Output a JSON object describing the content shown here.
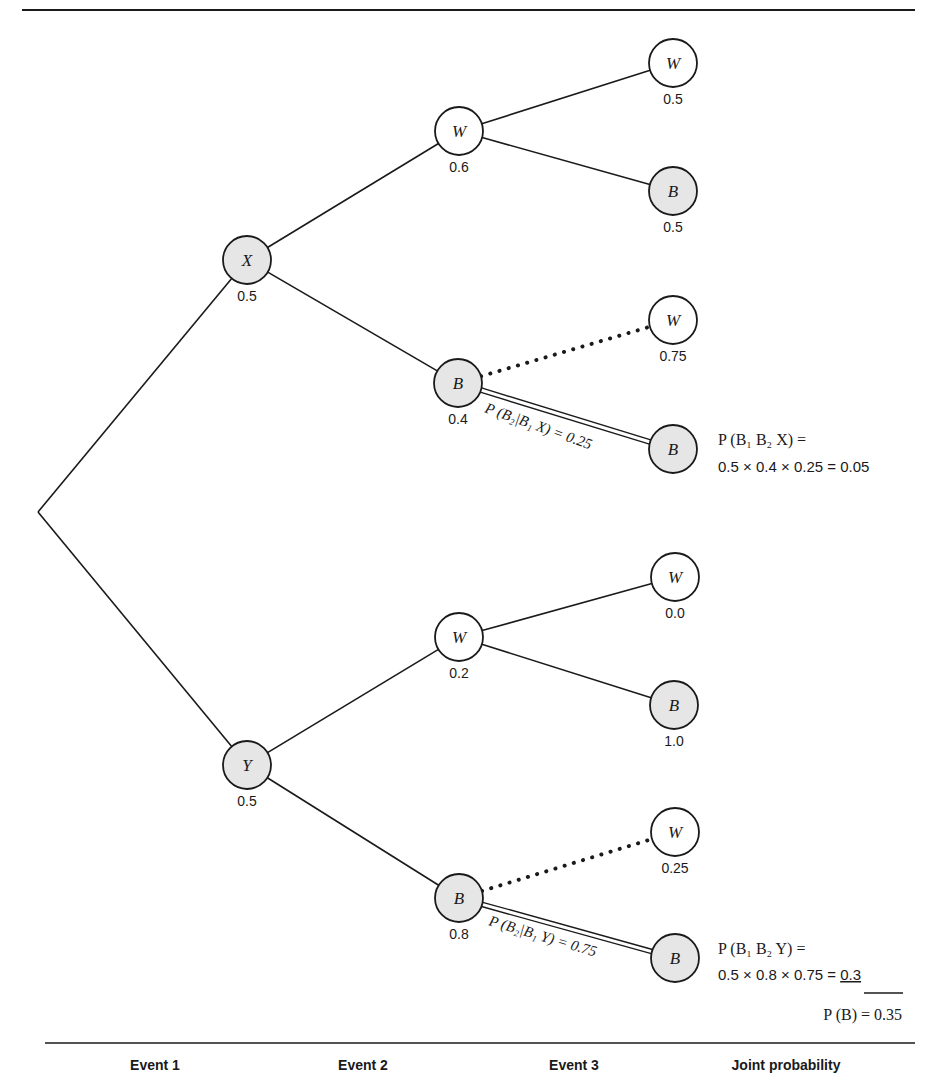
{
  "diagram": {
    "type": "probability-tree",
    "colors": {
      "line": "#1a1a1a",
      "shaded_node": "#e6e6e6",
      "white_node": "#ffffff"
    },
    "root": {
      "x": 38,
      "y": 512
    },
    "nodes": [
      {
        "id": "X",
        "letter": "X",
        "prob": "0.5",
        "x": 247,
        "y": 260,
        "shaded": true,
        "level": 1
      },
      {
        "id": "Y",
        "letter": "Y",
        "prob": "0.5",
        "x": 247,
        "y": 765,
        "shaded": true,
        "level": 1
      },
      {
        "id": "XW",
        "letter": "W",
        "prob": "0.6",
        "x": 459,
        "y": 131,
        "shaded": false,
        "level": 2
      },
      {
        "id": "XB",
        "letter": "B",
        "prob": "0.4",
        "x": 458,
        "y": 383,
        "shaded": true,
        "level": 2
      },
      {
        "id": "YW",
        "letter": "W",
        "prob": "0.2",
        "x": 459,
        "y": 637,
        "shaded": false,
        "level": 2
      },
      {
        "id": "YB",
        "letter": "B",
        "prob": "0.8",
        "x": 459,
        "y": 898,
        "shaded": true,
        "level": 2
      },
      {
        "id": "XWW",
        "letter": "W",
        "prob": "0.5",
        "x": 673,
        "y": 63,
        "shaded": false,
        "level": 3
      },
      {
        "id": "XWB",
        "letter": "B",
        "prob": "0.5",
        "x": 673,
        "y": 191,
        "shaded": true,
        "level": 3
      },
      {
        "id": "XBW",
        "letter": "W",
        "prob": "0.75",
        "x": 673,
        "y": 320,
        "shaded": false,
        "level": 3
      },
      {
        "id": "XBB",
        "letter": "B",
        "prob": "",
        "x": 673,
        "y": 449,
        "shaded": true,
        "level": 3
      },
      {
        "id": "YWW",
        "letter": "W",
        "prob": "0.0",
        "x": 675,
        "y": 577,
        "shaded": false,
        "level": 3
      },
      {
        "id": "YWB",
        "letter": "B",
        "prob": "1.0",
        "x": 674,
        "y": 705,
        "shaded": true,
        "level": 3
      },
      {
        "id": "YBW",
        "letter": "W",
        "prob": "0.25",
        "x": 675,
        "y": 832,
        "shaded": false,
        "level": 3
      },
      {
        "id": "YBB",
        "letter": "B",
        "prob": "",
        "x": 675,
        "y": 958,
        "shaded": true,
        "level": 3
      }
    ],
    "edges": [
      {
        "from": "root",
        "to": "X",
        "style": "solid"
      },
      {
        "from": "root",
        "to": "Y",
        "style": "solid"
      },
      {
        "from": "X",
        "to": "XW",
        "style": "solid"
      },
      {
        "from": "X",
        "to": "XB",
        "style": "solid"
      },
      {
        "from": "Y",
        "to": "YW",
        "style": "solid"
      },
      {
        "from": "Y",
        "to": "YB",
        "style": "solid"
      },
      {
        "from": "XW",
        "to": "XWW",
        "style": "solid"
      },
      {
        "from": "XW",
        "to": "XWB",
        "style": "solid"
      },
      {
        "from": "XB",
        "to": "XBW",
        "style": "dotted"
      },
      {
        "from": "XB",
        "to": "XBB",
        "style": "double"
      },
      {
        "from": "YW",
        "to": "YWW",
        "style": "solid"
      },
      {
        "from": "YW",
        "to": "YWB",
        "style": "solid"
      },
      {
        "from": "YB",
        "to": "YBW",
        "style": "dotted"
      },
      {
        "from": "YB",
        "to": "YBB",
        "style": "double"
      }
    ],
    "edge_labels": {
      "xbb": "P (B₂|B₁ X) = 0.25",
      "ybb": "P (B₂|B₁ Y) = 0.75"
    },
    "joint": {
      "x": {
        "line1": "P (B₁ B₂ X) =",
        "line2": "0.5 × 0.4 × 0.25 = 0.05"
      },
      "y": {
        "line1": "P (B₁ B₂ Y) =",
        "line2_prefix": "0.5 × 0.8 × 0.75 = ",
        "line2_value": "0.3"
      },
      "total": "P (B) = 0.35"
    },
    "footer": {
      "event1": "Event 1",
      "event2": "Event 2",
      "event3": "Event 3",
      "joint": "Joint probability"
    }
  }
}
